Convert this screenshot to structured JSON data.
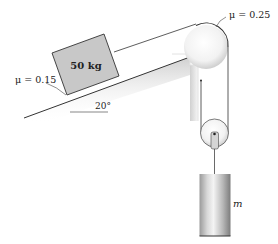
{
  "diagram": {
    "type": "physics-mechanics",
    "block": {
      "label": "50 kg",
      "mass": "50 kg"
    },
    "incline": {
      "angle_label": "20°",
      "friction_label": "μ = 0.15"
    },
    "fixed_pulley": {
      "friction_label": "μ = 0.25"
    },
    "hanging_mass": {
      "label": "m"
    }
  },
  "colors": {
    "line": "#333333",
    "block_fill": "#c8c8c8",
    "pulley_fill": "#eeeeee",
    "cylinder_dark": "#8a8a8a",
    "cylinder_light": "#f0f0f0"
  }
}
